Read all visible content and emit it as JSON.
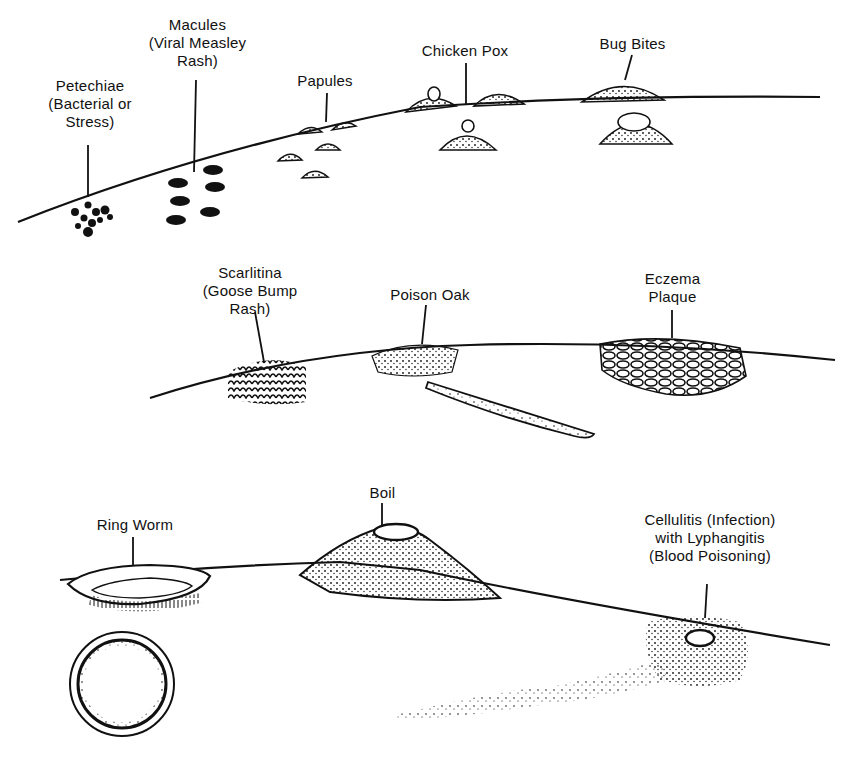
{
  "panels": [
    {
      "name": "top",
      "labels": [
        {
          "id": "petechiae",
          "lines": [
            "Petechiae",
            "(Bacterial or",
            "Stress)"
          ]
        },
        {
          "id": "macules",
          "lines": [
            "Macules",
            "(Viral Measley",
            "Rash)"
          ]
        },
        {
          "id": "papules",
          "lines": [
            "Papules"
          ]
        },
        {
          "id": "chicken_pox",
          "lines": [
            "Chicken Pox"
          ]
        },
        {
          "id": "bug_bites",
          "lines": [
            "Bug Bites"
          ]
        }
      ]
    },
    {
      "name": "middle",
      "labels": [
        {
          "id": "scarlitina",
          "lines": [
            "Scarlitina",
            "(Goose Bump",
            "Rash)"
          ]
        },
        {
          "id": "poison_oak",
          "lines": [
            "Poison Oak"
          ]
        },
        {
          "id": "eczema",
          "lines": [
            "Eczema",
            "Plaque"
          ]
        }
      ]
    },
    {
      "name": "bottom",
      "labels": [
        {
          "id": "ring_worm",
          "lines": [
            "Ring Worm"
          ]
        },
        {
          "id": "boil",
          "lines": [
            "Boil"
          ]
        },
        {
          "id": "cellulitis",
          "lines": [
            "Cellulitis (Infection)",
            "with Lyphangitis",
            "(Blood Poisoning)"
          ]
        }
      ]
    }
  ],
  "colors": {
    "ink": "#111111",
    "paper": "#ffffff"
  }
}
